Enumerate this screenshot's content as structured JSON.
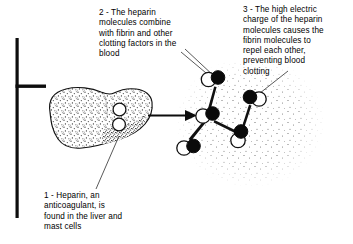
{
  "figure": {
    "background_color": "#ffffff",
    "ink_color": "#000000"
  },
  "captions": [
    {
      "id": "caption-1",
      "number": "1",
      "text": "1 - Heparin, an\nanticoagulant, is\nfound in the liver and\nmast cells"
    },
    {
      "id": "caption-2",
      "number": "2",
      "text": "2 - The heparin\nmolecules combine\nwith fibrin and other\nclotting factors in the\nblood"
    },
    {
      "id": "caption-3",
      "number": "3",
      "text": "3 - The high electric\ncharge of the heparin\nmolecules causes the\nfibrin molecules to\nrepel each other,\npreventing blood\nclotting"
    }
  ],
  "organ": {
    "name": "liver",
    "label": "Liver with stippled texture and two mast-cell circles",
    "mast_cells": 2
  },
  "molecules": {
    "label": "Heparin-fibrin molecule pairs in blood plasma",
    "count": 6,
    "white_lobe_color": "#ffffff",
    "black_lobe_color": "#000000"
  },
  "flow_arrow": {
    "label": "arrow from liver to blood molecules",
    "direction": "right"
  },
  "frame_mark": {
    "label": "left registration bracket"
  }
}
